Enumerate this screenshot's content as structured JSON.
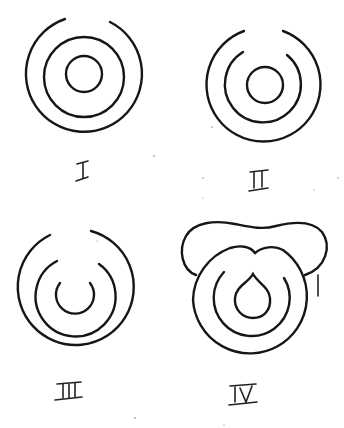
{
  "figure": {
    "stroke_color": "#161616",
    "background": "#ffffff"
  },
  "panels": [
    {
      "id": "I",
      "label": "I",
      "rings": [
        "outer ring, open at top",
        "middle ring, closed",
        "inner ring, closed"
      ]
    },
    {
      "id": "II",
      "label": "II",
      "rings": [
        "outer ring, open at top",
        "middle ring, open at top",
        "inner ring, closed"
      ]
    },
    {
      "id": "III",
      "label": "III",
      "rings": [
        "outer ring, open at top",
        "middle ring, open at top",
        "inner ring, open at top (U shape)"
      ]
    },
    {
      "id": "IV",
      "label": "IV",
      "rings": [
        "outer ring with top notch",
        "middle ring, open at top",
        "inner teardrop"
      ],
      "extra": "cloud-like lobed outline surrounding top"
    }
  ]
}
